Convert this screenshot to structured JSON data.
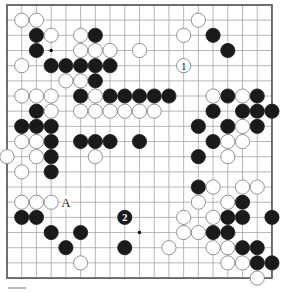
{
  "diagram": {
    "type": "go-board",
    "size": 19,
    "colors": {
      "black": "#1a1a1a",
      "white": "#ffffff",
      "line": "#9a9a9a",
      "border": "#555555"
    },
    "star_points": [
      [
        3,
        3
      ],
      [
        9,
        15
      ]
    ],
    "black_stones": [
      [
        2,
        2
      ],
      [
        6,
        2
      ],
      [
        14,
        2
      ],
      [
        2,
        3
      ],
      [
        15,
        3
      ],
      [
        3,
        4
      ],
      [
        4,
        4
      ],
      [
        5,
        4
      ],
      [
        6,
        4
      ],
      [
        7,
        4
      ],
      [
        6,
        5
      ],
      [
        5,
        6
      ],
      [
        7,
        6
      ],
      [
        8,
        6
      ],
      [
        9,
        6
      ],
      [
        10,
        6
      ],
      [
        11,
        6
      ],
      [
        15,
        6
      ],
      [
        17,
        6
      ],
      [
        2,
        7
      ],
      [
        14,
        7
      ],
      [
        16,
        7
      ],
      [
        17,
        7
      ],
      [
        18,
        7
      ],
      [
        1,
        8
      ],
      [
        2,
        8
      ],
      [
        3,
        8
      ],
      [
        13,
        8
      ],
      [
        15,
        8
      ],
      [
        17,
        8
      ],
      [
        3,
        9
      ],
      [
        5,
        9
      ],
      [
        6,
        9
      ],
      [
        7,
        9
      ],
      [
        9,
        9
      ],
      [
        14,
        9
      ],
      [
        3,
        10
      ],
      [
        13,
        10
      ],
      [
        3,
        11
      ],
      [
        13,
        12
      ],
      [
        16,
        13
      ],
      [
        1,
        14
      ],
      [
        2,
        14
      ],
      [
        15,
        14
      ],
      [
        16,
        14
      ],
      [
        18,
        14
      ],
      [
        3,
        15
      ],
      [
        5,
        15
      ],
      [
        14,
        15
      ],
      [
        15,
        15
      ],
      [
        4,
        16
      ],
      [
        8,
        16
      ],
      [
        16,
        16
      ],
      [
        17,
        16
      ],
      [
        17,
        17
      ],
      [
        18,
        17
      ]
    ],
    "white_stones": [
      [
        1,
        1
      ],
      [
        2,
        1
      ],
      [
        13,
        1
      ],
      [
        3,
        2
      ],
      [
        5,
        2
      ],
      [
        12,
        2
      ],
      [
        5,
        3
      ],
      [
        6,
        3
      ],
      [
        7,
        3
      ],
      [
        9,
        3
      ],
      [
        1,
        4
      ],
      [
        4,
        5
      ],
      [
        5,
        5
      ],
      [
        1,
        6
      ],
      [
        2,
        6
      ],
      [
        3,
        6
      ],
      [
        6,
        6
      ],
      [
        14,
        6
      ],
      [
        16,
        6
      ],
      [
        3,
        7
      ],
      [
        5,
        7
      ],
      [
        6,
        7
      ],
      [
        7,
        7
      ],
      [
        8,
        7
      ],
      [
        9,
        7
      ],
      [
        10,
        7
      ],
      [
        16,
        8
      ],
      [
        1,
        9
      ],
      [
        2,
        9
      ],
      [
        15,
        9
      ],
      [
        16,
        9
      ],
      [
        0,
        10
      ],
      [
        2,
        10
      ],
      [
        6,
        10
      ],
      [
        15,
        10
      ],
      [
        1,
        11
      ],
      [
        14,
        12
      ],
      [
        16,
        12
      ],
      [
        17,
        12
      ],
      [
        1,
        13
      ],
      [
        2,
        13
      ],
      [
        3,
        13
      ],
      [
        13,
        13
      ],
      [
        15,
        13
      ],
      [
        12,
        14
      ],
      [
        14,
        14
      ],
      [
        12,
        15
      ],
      [
        13,
        15
      ],
      [
        11,
        16
      ],
      [
        14,
        16
      ],
      [
        15,
        16
      ],
      [
        5,
        17
      ],
      [
        15,
        17
      ],
      [
        16,
        17
      ],
      [
        17,
        18
      ]
    ],
    "numbered_moves": [
      {
        "color": "white",
        "pos": [
          12,
          4
        ],
        "label": "1"
      },
      {
        "color": "black",
        "pos": [
          8,
          14
        ],
        "label": "2"
      }
    ],
    "letter_marks": [
      {
        "pos": [
          4,
          13
        ],
        "label": "A"
      }
    ]
  }
}
